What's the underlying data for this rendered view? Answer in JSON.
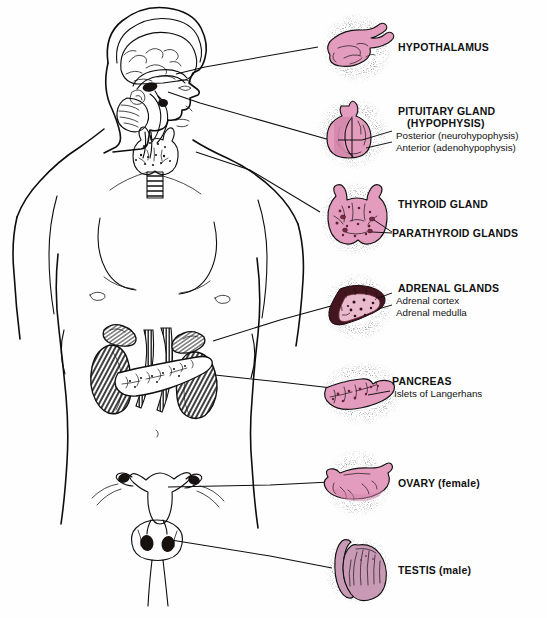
{
  "colors": {
    "gland_pink": "#e49cbe",
    "gland_pink_light": "#edb9d0",
    "gland_pink_deep": "#d487ab",
    "adrenal_cortex": "#43161f",
    "adrenal_medulla": "#e9b9cc",
    "testis_purple": "#c99ab6",
    "ink": "#0d0d0d",
    "stipple": "#2b2b2b",
    "background": "#ffffff"
  },
  "insets": [
    {
      "id": "hypothalamus",
      "icon": "hypothalamus-organ-icon",
      "labels": [
        {
          "text": "HYPOTHALAMUS",
          "style": "main"
        }
      ]
    },
    {
      "id": "pituitary",
      "icon": "pituitary-organ-icon",
      "labels": [
        {
          "text": "PITUITARY GLAND",
          "style": "main"
        },
        {
          "text": "(HYPOPHYSIS)",
          "style": "main"
        },
        {
          "text": "Posterior (neurohypophysis)",
          "style": "sub"
        },
        {
          "text": "Anterior (adenohypophysis)",
          "style": "sub"
        }
      ]
    },
    {
      "id": "thyroid",
      "icon": "thyroid-organ-icon",
      "labels": [
        {
          "text": "THYROID GLAND",
          "style": "main"
        },
        {
          "text": "PARATHYROID GLANDS",
          "style": "main"
        }
      ]
    },
    {
      "id": "adrenal",
      "icon": "adrenal-organ-icon",
      "labels": [
        {
          "text": "ADRENAL GLANDS",
          "style": "main"
        },
        {
          "text": "Adrenal cortex",
          "style": "sub"
        },
        {
          "text": "Adrenal medulla",
          "style": "sub"
        }
      ]
    },
    {
      "id": "pancreas",
      "icon": "pancreas-organ-icon",
      "labels": [
        {
          "text": "PANCREAS",
          "style": "main"
        },
        {
          "text": "Islets of Langerhans",
          "style": "sub"
        }
      ]
    },
    {
      "id": "ovary",
      "icon": "ovary-organ-icon",
      "labels": [
        {
          "text": "OVARY (female)",
          "style": "main"
        }
      ]
    },
    {
      "id": "testis",
      "icon": "testis-organ-icon",
      "labels": [
        {
          "text": "TESTIS (male)",
          "style": "main"
        }
      ]
    }
  ],
  "body_parts": [
    {
      "id": "head",
      "name": "head-sagittal-section"
    },
    {
      "id": "brain",
      "name": "brain-sagittal-icon"
    },
    {
      "id": "hypothalamus_marker",
      "name": "hypothalamus-marker-icon"
    },
    {
      "id": "pituitary_marker",
      "name": "pituitary-marker-icon"
    },
    {
      "id": "thyroid_body",
      "name": "thyroid-in-neck-icon"
    },
    {
      "id": "torso",
      "name": "torso-outline"
    },
    {
      "id": "kidneys",
      "name": "kidneys-icon"
    },
    {
      "id": "adrenals_body",
      "name": "adrenal-glands-on-kidneys-icon"
    },
    {
      "id": "pancreas_body",
      "name": "pancreas-in-abdomen-icon"
    },
    {
      "id": "uterus",
      "name": "uterus-and-ovaries-icon"
    },
    {
      "id": "testes_body",
      "name": "testes-scrotum-icon"
    }
  ],
  "label_text": {
    "hypothalamus": "HYPOTHALAMUS",
    "pituitary_1": "PITUITARY GLAND",
    "pituitary_2": "(HYPOPHYSIS)",
    "pituitary_post": "Posterior (neurohypophysis)",
    "pituitary_ant": "Anterior (adenohypophysis)",
    "thyroid": "THYROID GLAND",
    "parathyroid": "PARATHYROID GLANDS",
    "adrenal": "ADRENAL GLANDS",
    "adrenal_cortex": "Adrenal cortex",
    "adrenal_medulla": "Adrenal medulla",
    "pancreas": "PANCREAS",
    "islets": "Islets of Langerhans",
    "ovary": "OVARY (female)",
    "testis": "TESTIS (male)"
  }
}
